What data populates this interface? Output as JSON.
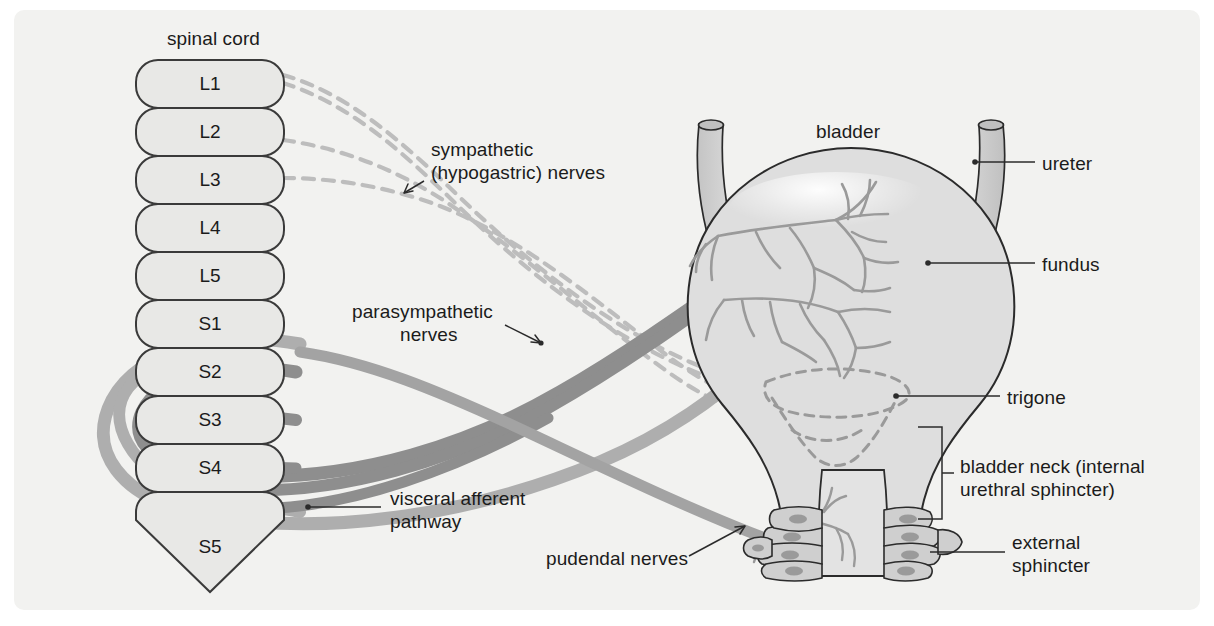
{
  "figure": {
    "background_color": "#f2f2f0",
    "page_color": "#ffffff"
  },
  "palette": {
    "segment_fill": "#e8e8e6",
    "segment_stroke": "#3a3a3a",
    "organ_fill": "#dedede",
    "organ_stroke": "#2b2b2b",
    "ureter_fill": "#cfcfcf",
    "parasympathetic_color": "#8e8e8e",
    "visceral_afferent_color": "#aeaeae",
    "sympathetic_color": "#b9b9b9",
    "pudendal_color": "#a0a0a0",
    "plexus_color": "#9a9a9a",
    "leader_color": "#2b2b2b",
    "text_color": "#1b1b1b"
  },
  "spinal_cord": {
    "title": "spinal cord",
    "segments": [
      {
        "label": "L1"
      },
      {
        "label": "L2"
      },
      {
        "label": "L3"
      },
      {
        "label": "L4"
      },
      {
        "label": "L5"
      },
      {
        "label": "S1"
      },
      {
        "label": "S2"
      },
      {
        "label": "S3"
      },
      {
        "label": "S4"
      },
      {
        "label": "S5"
      }
    ]
  },
  "nerve_labels": {
    "sympathetic_line1": "sympathetic",
    "sympathetic_line2": "(hypogastric) nerves",
    "parasympathetic_line1": "parasympathetic",
    "parasympathetic_line2": "nerves",
    "visceral_afferent_line1": "visceral afferent",
    "visceral_afferent_line2": "pathway",
    "pudendal": "pudendal nerves"
  },
  "organ_labels": {
    "bladder": "bladder",
    "ureter": "ureter",
    "fundus": "fundus",
    "trigone": "trigone",
    "bladder_neck_line1": "bladder neck (internal",
    "bladder_neck_line2": "urethral sphincter)",
    "external_sphincter_line1": "external",
    "external_sphincter_line2": "sphincter"
  }
}
